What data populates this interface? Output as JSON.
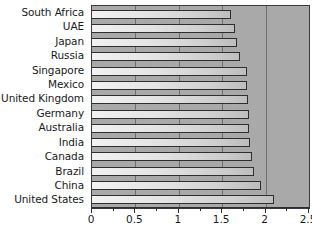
{
  "chart_data": {
    "type": "bar",
    "orientation": "horizontal",
    "title": "",
    "subtitle": "",
    "xlabel": "",
    "ylabel": "",
    "categories": [
      "South Africa",
      "UAE",
      "Japan",
      "Russia",
      "Singapore",
      "Mexico",
      "United Kingdom",
      "Germany",
      "Australia",
      "India",
      "Canada",
      "Brazil",
      "China",
      "United States"
    ],
    "values": [
      1.6,
      1.65,
      1.67,
      1.7,
      1.78,
      1.78,
      1.8,
      1.81,
      1.81,
      1.82,
      1.84,
      1.87,
      1.95,
      2.1
    ],
    "xlim": [
      0,
      2.5
    ],
    "xticks": [
      0,
      0.5,
      1,
      1.5,
      2,
      2.5
    ],
    "xtick_labels": [
      "0",
      "0.5",
      "1",
      "1.5",
      "2",
      "2.5"
    ],
    "minor_tick_step": 0.25,
    "grid": true,
    "grid_axis": "x",
    "legend": false,
    "legend_position": "none",
    "annotations": []
  },
  "style": {
    "plot_background": "#a9a9a9",
    "gridline_color": "#6e6e6e",
    "bar_border": "#2e2e2e",
    "bar_fill_start": "#f2f2f2",
    "bar_fill_end": "#bdbdbd",
    "axis_color": "#2e2e2e",
    "text_color": "#1a1a1a",
    "page_background": "#ffffff"
  }
}
